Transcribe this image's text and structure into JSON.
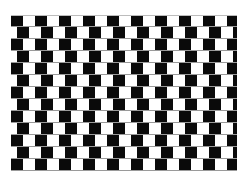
{
  "illusion": {
    "name": "cafe-wall",
    "rows": 13,
    "tiles_per_row": 20,
    "tile_width": 12,
    "row_height": 12,
    "odd_row_offset": 6,
    "origin": {
      "x": 11,
      "y": 15
    },
    "size": {
      "width": 226,
      "height": 158
    },
    "colors": {
      "dark_tile": "#0a0a0a",
      "light_tile": "#ffffff",
      "mortar": "#9a9a9a",
      "background": "#ffffff"
    }
  }
}
